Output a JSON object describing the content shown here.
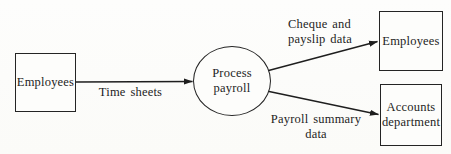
{
  "diagram": {
    "kind": "data-flow-diagram",
    "colors": {
      "background": "#fcfcfa",
      "ink": "#1e1e1e"
    },
    "nodes": {
      "source_employees": {
        "shape": "rectangle",
        "label": "Employees"
      },
      "process_payroll": {
        "shape": "circle",
        "line1": "Process",
        "line2": "payroll"
      },
      "sink_employees": {
        "shape": "rectangle",
        "label": "Employees"
      },
      "accounts_department": {
        "shape": "rectangle",
        "line1": "Accounts",
        "line2": "department"
      }
    },
    "edges": {
      "time_sheets": {
        "from": "source_employees",
        "to": "process_payroll",
        "label": "Time sheets"
      },
      "cheque_payslip": {
        "from": "process_payroll",
        "to": "sink_employees",
        "line1": "Cheque and",
        "line2": "payslip data"
      },
      "payroll_summary": {
        "from": "process_payroll",
        "to": "accounts_department",
        "line1": "Payroll summary",
        "line2": "data"
      }
    }
  }
}
